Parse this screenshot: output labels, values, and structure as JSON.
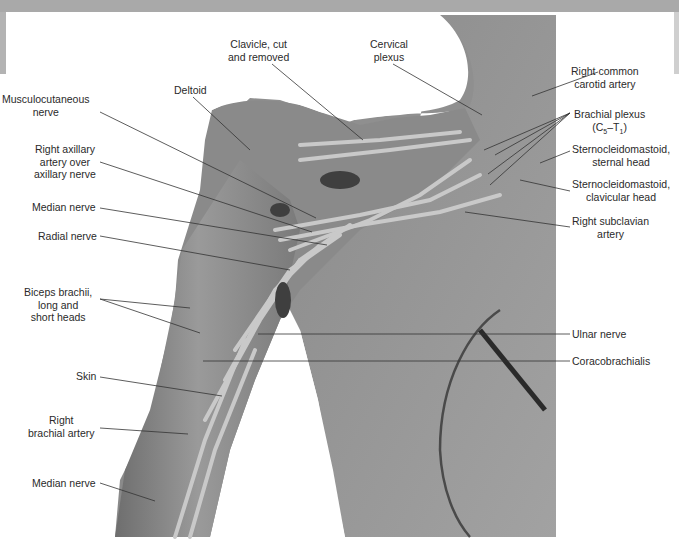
{
  "figure": {
    "type": "anatomical dissection photograph",
    "colors": {
      "specimen_base": "#8c8c8c",
      "specimen_light": "#b5b5b5",
      "specimen_dark": "#4a4a4a",
      "background": "#ffffff",
      "banner": "#a9a9a9",
      "leader_line": "#333333",
      "label_text": "#2a2a2a"
    }
  },
  "labels": {
    "left": [
      {
        "id": "musculocutaneous",
        "lines": [
          "Musculocutaneous",
          "nerve"
        ]
      },
      {
        "id": "deltoid",
        "lines": [
          "Deltoid"
        ]
      },
      {
        "id": "right-axillary-artery",
        "lines": [
          "Right axillary",
          "artery over",
          "axillary nerve"
        ]
      },
      {
        "id": "median-nerve-upper",
        "lines": [
          "Median nerve"
        ]
      },
      {
        "id": "radial-nerve",
        "lines": [
          "Radial nerve"
        ]
      },
      {
        "id": "biceps-brachii",
        "lines": [
          "Biceps brachii,",
          "long and",
          "short heads"
        ]
      },
      {
        "id": "skin",
        "lines": [
          "Skin"
        ]
      },
      {
        "id": "right-brachial-artery",
        "lines": [
          "Right",
          "brachial artery"
        ]
      },
      {
        "id": "median-nerve-lower",
        "lines": [
          "Median nerve"
        ]
      }
    ],
    "top": [
      {
        "id": "clavicle",
        "lines": [
          "Clavicle, cut",
          "and removed"
        ]
      },
      {
        "id": "cervical-plexus",
        "lines": [
          "Cervical",
          "plexus"
        ]
      }
    ],
    "right": [
      {
        "id": "right-common-carotid",
        "lines": [
          "Right common",
          "carotid artery"
        ]
      },
      {
        "id": "brachial-plexus",
        "lines": [
          "Brachial plexus"
        ],
        "subline": {
          "prefix": "(C",
          "sub1": "5",
          "mid": "–T",
          "sub2": "1",
          "suffix": ")"
        }
      },
      {
        "id": "scm-sternal",
        "lines": [
          "Sternocleidomastoid,",
          "sternal head"
        ]
      },
      {
        "id": "scm-clavicular",
        "lines": [
          "Sternocleidomastoid,",
          "clavicular head"
        ]
      },
      {
        "id": "right-subclavian",
        "lines": [
          "Right subclavian",
          "artery"
        ]
      },
      {
        "id": "ulnar-nerve",
        "lines": [
          "Ulnar nerve"
        ]
      },
      {
        "id": "coracobrachialis",
        "lines": [
          "Coracobrachialis"
        ]
      }
    ]
  }
}
